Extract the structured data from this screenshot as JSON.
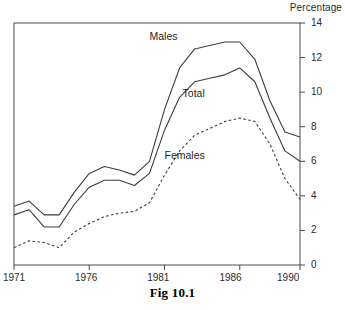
{
  "figure": {
    "caption": "Fig 10.1",
    "y_axis_title": "Percentage"
  },
  "chart_data": {
    "type": "line",
    "title": "Fig 10.1",
    "xlabel": "",
    "ylabel": "Percentage",
    "xlim": [
      1971,
      1990
    ],
    "ylim": [
      0,
      14
    ],
    "grid": false,
    "legend": "inline-labels",
    "x": [
      1971,
      1972,
      1973,
      1974,
      1975,
      1976,
      1977,
      1978,
      1979,
      1980,
      1981,
      1982,
      1983,
      1984,
      1985,
      1986,
      1987,
      1988,
      1989,
      1990
    ],
    "xticks": [
      1971,
      1976,
      1981,
      1986,
      1990
    ],
    "xtick_labels": [
      "1971",
      "1976",
      "1981",
      "1986",
      "1990"
    ],
    "yticks": [
      0,
      2,
      4,
      6,
      8,
      10,
      12,
      14
    ],
    "ytick_labels": [
      "0",
      "2",
      "4",
      "6",
      "8",
      "10",
      "12",
      "14"
    ],
    "series": [
      {
        "name": "Males",
        "label": "Males",
        "style": "solid",
        "color": "#3d3d3d",
        "values": [
          3.4,
          3.7,
          2.9,
          2.9,
          4.2,
          5.3,
          5.7,
          5.5,
          5.2,
          6.0,
          9.0,
          11.4,
          12.5,
          12.7,
          12.9,
          12.9,
          11.9,
          9.5,
          7.7,
          7.4
        ]
      },
      {
        "name": "Total",
        "label": "Total",
        "style": "solid",
        "color": "#3d3d3d",
        "values": [
          2.9,
          3.2,
          2.2,
          2.2,
          3.5,
          4.5,
          4.9,
          4.9,
          4.6,
          5.3,
          7.8,
          9.7,
          10.6,
          10.8,
          11.0,
          11.4,
          10.6,
          8.5,
          6.6,
          6.0
        ]
      },
      {
        "name": "Females",
        "label": "Females",
        "style": "dashed",
        "color": "#3d3d3d",
        "values": [
          1.0,
          1.4,
          1.3,
          1.0,
          1.9,
          2.4,
          2.8,
          3.0,
          3.1,
          3.6,
          5.2,
          6.6,
          7.5,
          7.9,
          8.3,
          8.5,
          8.3,
          7.0,
          5.0,
          3.8
        ]
      }
    ],
    "annotations": [
      {
        "text": "Males",
        "x": 1980.0,
        "y": 13.2
      },
      {
        "text": "Total",
        "x": 1982.2,
        "y": 9.9
      },
      {
        "text": "Females",
        "x": 1981.0,
        "y": 6.3
      }
    ]
  },
  "axes": {
    "y_ticks": [
      {
        "value": "14",
        "pos": 23
      },
      {
        "value": "12",
        "pos": 57.6
      },
      {
        "value": "10",
        "pos": 92.1
      },
      {
        "value": "8",
        "pos": 126.7
      },
      {
        "value": "6",
        "pos": 161.3
      },
      {
        "value": "4",
        "pos": 195.9
      },
      {
        "value": "2",
        "pos": 230.4
      },
      {
        "value": "0",
        "pos": 265
      }
    ],
    "x_ticks": [
      {
        "value": "1971",
        "pos": 14
      },
      {
        "value": "1976",
        "pos": 86.2
      },
      {
        "value": "1981",
        "pos": 158.3
      },
      {
        "value": "1986",
        "pos": 230.5
      },
      {
        "value": "1990",
        "pos": 288.2
      }
    ]
  }
}
